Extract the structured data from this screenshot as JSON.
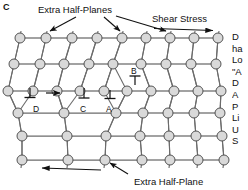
{
  "figure": {
    "panel_label": "C",
    "title_top": "Extra Half-Planes",
    "title_shear": "Shear Stress",
    "title_bottom": "Extra Half-Plane",
    "dislocation_labels": {
      "A": "A",
      "B": "B",
      "C": "C",
      "D": "D"
    },
    "colors": {
      "atom_fill": "#d9d9d9",
      "atom_stroke": "#444444",
      "bond": "#6b6b6b",
      "text": "#111111",
      "background": "#ffffff"
    },
    "side_text_clipped": [
      "D",
      "ha",
      "Lo",
      "\"A",
      "D",
      "A",
      "P",
      "Li",
      "U",
      "S"
    ]
  },
  "lattice": {
    "rows": [
      {
        "index": 1,
        "atom_count": 9,
        "y": 38,
        "x": [
          20,
          46,
          72,
          97,
          122,
          146,
          170,
          194,
          218
        ]
      },
      {
        "index": 2,
        "atom_count": 9,
        "y": 64,
        "x": [
          14,
          40,
          64,
          89,
          113,
          141,
          166,
          191,
          216
        ]
      },
      {
        "index": 3,
        "atom_count": 10,
        "y": 91,
        "x": [
          8,
          33,
          57,
          80,
          104,
          127,
          151,
          174,
          198,
          221
        ]
      },
      {
        "index": 4,
        "atom_count": 7,
        "y": 113,
        "x": [
          18,
          64,
          116,
          143,
          168,
          194,
          220
        ]
      },
      {
        "index": 5,
        "atom_count": 7,
        "y": 136,
        "x": [
          22,
          67,
          106,
          140,
          169,
          196,
          222
        ]
      },
      {
        "index": 6,
        "atom_count": 7,
        "y": 160,
        "x": [
          22,
          68,
          105,
          142,
          170,
          198,
          224
        ]
      }
    ],
    "atom_radius": 5.0,
    "extra_half_plane_arrow_targets_top": [
      46,
      122,
      170
    ],
    "extra_half_plane_arrow_target_bottom": 105,
    "shear_arrow_top": {
      "direction": "right",
      "x1": 155,
      "x2": 215,
      "y": 29
    },
    "shear_arrow_bottom": {
      "direction": "left",
      "x1": 40,
      "x2": 100,
      "y": 172
    },
    "glide_arrow": {
      "direction": "right",
      "x1": 47,
      "x2": 60,
      "y": 93
    },
    "dislocation_symbols": [
      {
        "label": "A",
        "x": 110,
        "y": 97,
        "orient": "up"
      },
      {
        "label": "B",
        "x": 135,
        "y": 75,
        "orient": "down"
      },
      {
        "label": "C",
        "x": 84,
        "y": 97,
        "orient": "down"
      },
      {
        "label": "D",
        "x": 37,
        "y": 95,
        "orient": "down"
      }
    ]
  }
}
